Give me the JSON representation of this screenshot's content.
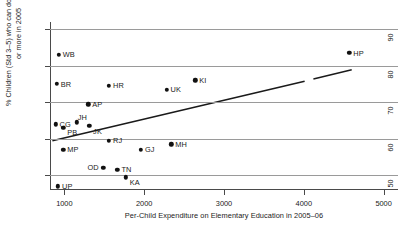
{
  "chart_data": {
    "type": "scatter",
    "title": "",
    "xlabel": "Per-Child Expenditure on Elementary Education in 2005–06",
    "ylabel": "% Children (Std 3–5) who can do subtraction\nor more in 2005",
    "ylabel_line1": "% Children (Std 3–5) who can do subtraction",
    "ylabel_line2": "or more in 2005",
    "xlim": [
      820,
      5180
    ],
    "ylim": [
      46,
      92
    ],
    "xticks": [
      1000,
      2000,
      3000,
      4000,
      5000
    ],
    "xticklabels": [
      "1000",
      "2000",
      "3000",
      "4000",
      "5000"
    ],
    "yticks": [
      50,
      60,
      70,
      80,
      90
    ],
    "yticklabels": [
      "50",
      "60",
      "70",
      "80",
      "90"
    ],
    "grid": "horizontal",
    "legend": "none",
    "marker": "filled-circle",
    "marker_color": "#111111",
    "points": [
      {
        "label": "WB",
        "x": 930,
        "y": 83.0,
        "label_pos": "right"
      },
      {
        "label": "BR",
        "x": 905,
        "y": 75.0,
        "label_pos": "right"
      },
      {
        "label": "HR",
        "x": 1560,
        "y": 74.5,
        "label_pos": "right"
      },
      {
        "label": "UK",
        "x": 2280,
        "y": 73.5,
        "label_pos": "right"
      },
      {
        "label": "KI",
        "x": 2640,
        "y": 76.0,
        "label_pos": "right"
      },
      {
        "label": "HP",
        "x": 4570,
        "y": 83.5,
        "label_pos": "right"
      },
      {
        "label": "AP",
        "x": 1300,
        "y": 69.5,
        "label_pos": "right"
      },
      {
        "label": "CG",
        "x": 890,
        "y": 64.0,
        "label_pos": "right"
      },
      {
        "label": "PB",
        "x": 985,
        "y": 63.0,
        "label_pos": "below-right"
      },
      {
        "label": "JH",
        "x": 1155,
        "y": 64.5,
        "label_pos": "above-right"
      },
      {
        "label": "JK",
        "x": 1310,
        "y": 63.5,
        "label_pos": "below-right"
      },
      {
        "label": "RJ",
        "x": 1560,
        "y": 59.5,
        "label_pos": "right"
      },
      {
        "label": "GJ",
        "x": 1960,
        "y": 57.0,
        "label_pos": "right"
      },
      {
        "label": "MH",
        "x": 2340,
        "y": 58.5,
        "label_pos": "right"
      },
      {
        "label": "MP",
        "x": 985,
        "y": 57.0,
        "label_pos": "right"
      },
      {
        "label": "OD",
        "x": 1490,
        "y": 52.0,
        "label_pos": "left"
      },
      {
        "label": "TN",
        "x": 1665,
        "y": 51.5,
        "label_pos": "right"
      },
      {
        "label": "KA",
        "x": 1770,
        "y": 49.5,
        "label_pos": "below-right"
      },
      {
        "label": "UP",
        "x": 920,
        "y": 47.0,
        "label_pos": "right"
      }
    ],
    "fit_line": {
      "type": "linear-fit",
      "color": "#1a1a1a",
      "segments": [
        {
          "x0": 850,
          "y0": 59.5,
          "x1": 4010,
          "y1": 75.8
        },
        {
          "x0": 4120,
          "y0": 76.4,
          "x1": 4600,
          "y1": 78.9
        }
      ]
    }
  }
}
